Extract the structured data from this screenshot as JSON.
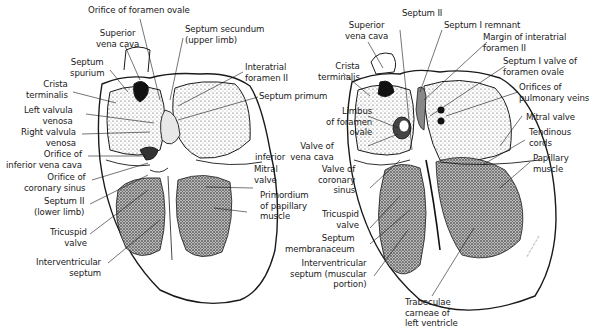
{
  "figure": {
    "left_panel": {
      "labels": [
        {
          "id": "orifice-foramen-ovale",
          "text": "Orifice of foramen ovale"
        },
        {
          "id": "superior-vena-cava-l",
          "text": "Superior\nvena cava"
        },
        {
          "id": "septum-secundum-upper",
          "text": "Septum secundum\n(upper limb)"
        },
        {
          "id": "septum-spurium",
          "text": "Septum\nspurium"
        },
        {
          "id": "crista-terminalis-l",
          "text": "Crista\nterminalis"
        },
        {
          "id": "interatrial-foramen-ii",
          "text": "Interatrial\nforamen II"
        },
        {
          "id": "septum-primum",
          "text": "Septum primum"
        },
        {
          "id": "left-valvula-venosa",
          "text": "Left valvula\nvenosa"
        },
        {
          "id": "right-valvula-venosa",
          "text": "Right valvula\nvenosa"
        },
        {
          "id": "orifice-ivc",
          "text": "Orifice of\ninferior vena cava"
        },
        {
          "id": "orifice-coronary-sinus",
          "text": "Orifice of\ncoronary sinus"
        },
        {
          "id": "septum-ii-lower",
          "text": "Septum II\n(lower limb)"
        },
        {
          "id": "tricuspid-valve-l",
          "text": "Tricuspid\nvalve"
        },
        {
          "id": "interventricular-septum",
          "text": "Interventricular\nseptum"
        },
        {
          "id": "mitral-valve-l",
          "text": "Mitral\nvalve"
        },
        {
          "id": "primordium-papillary",
          "text": "Primordium\nof papillary\nmuscle"
        }
      ]
    },
    "right_panel": {
      "labels": [
        {
          "id": "septum-ii",
          "text": "Septum II"
        },
        {
          "id": "superior-vena-cava-r",
          "text": "Superior\nvena cava"
        },
        {
          "id": "septum-i-remnant",
          "text": "Septum I remnant"
        },
        {
          "id": "margin-interatrial",
          "text": "Margin of interatrial\nforamen II"
        },
        {
          "id": "crista-terminalis-r",
          "text": "Crista\nterminalis"
        },
        {
          "id": "septum-i-valve",
          "text": "Septum I valve of\nforamen ovale"
        },
        {
          "id": "orifices-pulmonary",
          "text": "Orifices of\npulmonary veins"
        },
        {
          "id": "limbus-foramen-ovale",
          "text": "Limbus\nof foramen\novale"
        },
        {
          "id": "valve-ivc",
          "text": "Valve of\ninferior  vena cava"
        },
        {
          "id": "mitral-valve-r",
          "text": "Mitral valve"
        },
        {
          "id": "tendinous-cords",
          "text": "Tendinous\ncords"
        },
        {
          "id": "valve-coronary-sinus",
          "text": "Valve of\ncoronary\nsinus"
        },
        {
          "id": "papillary-muscle",
          "text": "Papillary\nmuscle"
        },
        {
          "id": "tricuspid-valve-r",
          "text": "Tricuspid\nvalve"
        },
        {
          "id": "septum-membranaceum",
          "text": "Septum\nmembranaceum"
        },
        {
          "id": "iv-septum-muscular",
          "text": "Interventricular\nseptum (muscular\nportion)"
        },
        {
          "id": "trabeculae-carneae",
          "text": "Trabeculae\ncarneae of\nleft ventricle"
        }
      ]
    },
    "colors": {
      "ink": "#1a1a1a",
      "stipple": "#2b2b2b",
      "paper": "#ffffff"
    }
  }
}
